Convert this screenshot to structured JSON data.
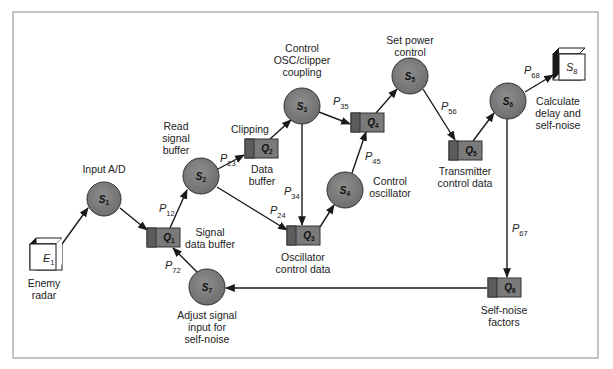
{
  "figure": {
    "colors": {
      "frame": "#8a8a8a",
      "state_fill": "#7d7d7d",
      "queue_fill": "#7a7a7a",
      "queue_left_fill": "#5c5c5c",
      "edge": "#1a1a1a",
      "cube_face": "#ffffff",
      "cube_side": "#1a1a1a"
    },
    "externals": [
      {
        "id": "E1",
        "symbol": "E",
        "sub": "1",
        "label_lines": [
          "Enemy",
          "radar"
        ]
      },
      {
        "id": "S8",
        "symbol": "S",
        "sub": "8",
        "label_lines": []
      }
    ],
    "states": [
      {
        "id": "S1",
        "symbol": "S",
        "sub": "1",
        "label_lines": [
          "Input A/D"
        ]
      },
      {
        "id": "S2",
        "symbol": "S",
        "sub": "2",
        "label_lines": [
          "Read",
          "signal",
          "buffer"
        ]
      },
      {
        "id": "S3",
        "symbol": "S",
        "sub": "3",
        "label_lines": [
          "Control",
          "OSC/clipper",
          "coupling"
        ]
      },
      {
        "id": "S4",
        "symbol": "S",
        "sub": "4",
        "label_lines": [
          "Control",
          "oscillator"
        ]
      },
      {
        "id": "S5",
        "symbol": "S",
        "sub": "5",
        "label_lines": [
          "Set power",
          "control"
        ]
      },
      {
        "id": "S6",
        "symbol": "S",
        "sub": "6",
        "label_lines": [
          "Calculate",
          "delay and",
          "self-noise"
        ]
      },
      {
        "id": "S7",
        "symbol": "S",
        "sub": "7",
        "label_lines": [
          "Adjust signal",
          "input for",
          "self-noise"
        ]
      }
    ],
    "queues": [
      {
        "id": "Q1",
        "symbol": "Q",
        "sub": "1",
        "label_lines": [
          "Signal",
          "data buffer"
        ]
      },
      {
        "id": "Q2",
        "symbol": "Q",
        "sub": "2",
        "label_lines": [
          "Clipping"
        ],
        "label_below": [
          "Data",
          "buffer"
        ]
      },
      {
        "id": "Q3",
        "symbol": "Q",
        "sub": "3",
        "label_lines": [
          "Oscillator",
          "control data"
        ]
      },
      {
        "id": "Q4",
        "symbol": "Q",
        "sub": "4",
        "label_lines": []
      },
      {
        "id": "Q5",
        "symbol": "Q",
        "sub": "5",
        "label_lines": [
          "Transmitter",
          "control data"
        ]
      },
      {
        "id": "Q6",
        "symbol": "Q",
        "sub": "6",
        "label_lines": [
          "Self-noise",
          "factors"
        ]
      }
    ],
    "edges": [
      {
        "from": "E1",
        "to": "S1",
        "label": ""
      },
      {
        "from": "S1",
        "to": "Q1",
        "label": ""
      },
      {
        "from": "Q1",
        "to": "S2",
        "p": "P",
        "sub": "12"
      },
      {
        "from": "S2",
        "to": "Q2",
        "p": "P",
        "sub": "23"
      },
      {
        "from": "S2",
        "to": "Q3",
        "p": "P",
        "sub": "24"
      },
      {
        "from": "Q2",
        "to": "S3",
        "label": ""
      },
      {
        "from": "S3",
        "to": "Q3",
        "p": "P",
        "sub": "34"
      },
      {
        "from": "S3",
        "to": "Q4",
        "p": "P",
        "sub": "35"
      },
      {
        "from": "Q3",
        "to": "S4",
        "label": ""
      },
      {
        "from": "S4",
        "to": "Q4",
        "p": "P",
        "sub": "45"
      },
      {
        "from": "Q4",
        "to": "S5",
        "label": ""
      },
      {
        "from": "S5",
        "to": "Q5",
        "p": "P",
        "sub": "56"
      },
      {
        "from": "Q5",
        "to": "S6",
        "label": ""
      },
      {
        "from": "S6",
        "to": "S8",
        "p": "P",
        "sub": "68"
      },
      {
        "from": "S6",
        "to": "Q6",
        "p": "P",
        "sub": "67"
      },
      {
        "from": "Q6",
        "to": "S7",
        "label": ""
      },
      {
        "from": "S7",
        "to": "Q1",
        "p": "P",
        "sub": "72"
      }
    ]
  }
}
